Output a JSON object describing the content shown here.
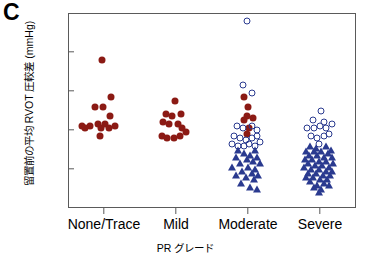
{
  "panel": {
    "letter": "C"
  },
  "axes": {
    "ylabel": "留置前の平均 RVOT 圧較差 (mmHg)",
    "xlabel": "PR グレード",
    "yticks": [
      0,
      20,
      40,
      60,
      80,
      100
    ],
    "ytick_labels": [
      "0",
      "20",
      "40",
      "60",
      "80",
      "100"
    ],
    "xtick_labels": [
      "None/Trace",
      "Mild",
      "Moderate",
      "Severe"
    ]
  },
  "colors": {
    "red": "#8B1A14",
    "blue": "#2A3A8F",
    "frame": "#5a5a5a",
    "background": "#ffffff"
  },
  "chart_data": {
    "type": "scatter",
    "title": "C",
    "xlabel": "PR グレード",
    "ylabel": "留置前の平均 RVOT 圧較差 (mmHg)",
    "ylim": [
      0,
      100
    ],
    "yticks": [
      0,
      20,
      40,
      60,
      80,
      100
    ],
    "grid": false,
    "legend": "none",
    "categories": [
      "None/Trace",
      "Mild",
      "Moderate",
      "Severe"
    ],
    "marker_types": [
      {
        "name": "filled-circle",
        "color": "#8B1A14",
        "shape": "circle",
        "fill": "solid"
      },
      {
        "name": "open-circle",
        "color": "#2A3A8F",
        "shape": "circle",
        "fill": "none"
      },
      {
        "name": "triangle",
        "color": "#2A3A8F",
        "shape": "triangle",
        "fill": "solid"
      }
    ],
    "series": [
      {
        "name": "filled-circle",
        "marker": "filled-circle",
        "points": [
          {
            "category": "None/Trace",
            "jitter": -0.03,
            "y": 76
          },
          {
            "category": "None/Trace",
            "jitter": 0.1,
            "y": 57
          },
          {
            "category": "None/Trace",
            "jitter": -0.12,
            "y": 52
          },
          {
            "category": "None/Trace",
            "jitter": -0.02,
            "y": 52
          },
          {
            "category": "None/Trace",
            "jitter": 0.08,
            "y": 47
          },
          {
            "category": "None/Trace",
            "jitter": -0.3,
            "y": 42
          },
          {
            "category": "None/Trace",
            "jitter": -0.2,
            "y": 42
          },
          {
            "category": "None/Trace",
            "jitter": -0.09,
            "y": 43
          },
          {
            "category": "None/Trace",
            "jitter": -0.04,
            "y": 41
          },
          {
            "category": "None/Trace",
            "jitter": 0.02,
            "y": 43
          },
          {
            "category": "None/Trace",
            "jitter": 0.07,
            "y": 41
          },
          {
            "category": "None/Trace",
            "jitter": 0.15,
            "y": 42
          },
          {
            "category": "None/Trace",
            "jitter": -0.05,
            "y": 37
          },
          {
            "category": "None/Trace",
            "jitter": -0.26,
            "y": 41
          },
          {
            "category": "Mild",
            "jitter": -0.02,
            "y": 55
          },
          {
            "category": "Mild",
            "jitter": -0.14,
            "y": 48
          },
          {
            "category": "Mild",
            "jitter": -0.05,
            "y": 47
          },
          {
            "category": "Mild",
            "jitter": 0.07,
            "y": 48
          },
          {
            "category": "Mild",
            "jitter": -0.18,
            "y": 44
          },
          {
            "category": "Mild",
            "jitter": -0.1,
            "y": 43
          },
          {
            "category": "Mild",
            "jitter": 0.03,
            "y": 43
          },
          {
            "category": "Mild",
            "jitter": 0.09,
            "y": 41
          },
          {
            "category": "Mild",
            "jitter": -0.2,
            "y": 37
          },
          {
            "category": "Mild",
            "jitter": -0.12,
            "y": 36
          },
          {
            "category": "Mild",
            "jitter": -0.03,
            "y": 36
          },
          {
            "category": "Mild",
            "jitter": 0.05,
            "y": 37
          },
          {
            "category": "Mild",
            "jitter": 0.14,
            "y": 39
          },
          {
            "category": "Moderate",
            "jitter": -0.05,
            "y": 57
          },
          {
            "category": "Moderate",
            "jitter": 0.0,
            "y": 52
          },
          {
            "category": "Moderate",
            "jitter": -0.02,
            "y": 47
          },
          {
            "category": "Moderate",
            "jitter": 0.07,
            "y": 46
          },
          {
            "category": "Moderate",
            "jitter": -0.06,
            "y": 45
          },
          {
            "category": "Moderate",
            "jitter": 0.01,
            "y": 41
          },
          {
            "category": "Moderate",
            "jitter": -0.01,
            "y": 38
          }
        ]
      },
      {
        "name": "open-circle",
        "marker": "open-circle",
        "points": [
          {
            "category": "Moderate",
            "jitter": -0.02,
            "y": 96
          },
          {
            "category": "Moderate",
            "jitter": -0.07,
            "y": 63
          },
          {
            "category": "Moderate",
            "jitter": 0.06,
            "y": 59
          },
          {
            "category": "Moderate",
            "jitter": -0.15,
            "y": 42
          },
          {
            "category": "Moderate",
            "jitter": -0.07,
            "y": 41
          },
          {
            "category": "Moderate",
            "jitter": 0.05,
            "y": 42
          },
          {
            "category": "Moderate",
            "jitter": 0.13,
            "y": 40
          },
          {
            "category": "Moderate",
            "jitter": -0.19,
            "y": 37
          },
          {
            "category": "Moderate",
            "jitter": -0.11,
            "y": 36
          },
          {
            "category": "Moderate",
            "jitter": -0.03,
            "y": 35
          },
          {
            "category": "Moderate",
            "jitter": 0.05,
            "y": 36
          },
          {
            "category": "Moderate",
            "jitter": 0.12,
            "y": 37
          },
          {
            "category": "Moderate",
            "jitter": -0.22,
            "y": 33
          },
          {
            "category": "Moderate",
            "jitter": -0.14,
            "y": 32
          },
          {
            "category": "Moderate",
            "jitter": -0.06,
            "y": 32
          },
          {
            "category": "Moderate",
            "jitter": 0.02,
            "y": 33
          },
          {
            "category": "Moderate",
            "jitter": 0.1,
            "y": 32
          },
          {
            "category": "Moderate",
            "jitter": 0.17,
            "y": 34
          },
          {
            "category": "Severe",
            "jitter": 0.02,
            "y": 50
          },
          {
            "category": "Severe",
            "jitter": -0.1,
            "y": 45
          },
          {
            "category": "Severe",
            "jitter": 0.06,
            "y": 44
          },
          {
            "category": "Severe",
            "jitter": -0.18,
            "y": 41
          },
          {
            "category": "Severe",
            "jitter": -0.09,
            "y": 41
          },
          {
            "category": "Severe",
            "jitter": 0.0,
            "y": 42
          },
          {
            "category": "Severe",
            "jitter": 0.09,
            "y": 41
          },
          {
            "category": "Severe",
            "jitter": 0.16,
            "y": 43
          },
          {
            "category": "Severe",
            "jitter": -0.13,
            "y": 37
          },
          {
            "category": "Severe",
            "jitter": -0.04,
            "y": 36
          },
          {
            "category": "Severe",
            "jitter": 0.05,
            "y": 37
          },
          {
            "category": "Severe",
            "jitter": 0.12,
            "y": 38
          },
          {
            "category": "Severe",
            "jitter": -0.02,
            "y": 33
          }
        ]
      },
      {
        "name": "triangle",
        "marker": "triangle",
        "points": [
          {
            "category": "Moderate",
            "jitter": -0.14,
            "y": 30
          },
          {
            "category": "Moderate",
            "jitter": 0.1,
            "y": 30
          },
          {
            "category": "Moderate",
            "jitter": -0.06,
            "y": 28
          },
          {
            "category": "Moderate",
            "jitter": 0.03,
            "y": 27
          },
          {
            "category": "Moderate",
            "jitter": -0.17,
            "y": 26
          },
          {
            "category": "Moderate",
            "jitter": 0.13,
            "y": 26
          },
          {
            "category": "Moderate",
            "jitter": -0.02,
            "y": 25
          },
          {
            "category": "Moderate",
            "jitter": 0.07,
            "y": 24
          },
          {
            "category": "Moderate",
            "jitter": -0.11,
            "y": 23
          },
          {
            "category": "Moderate",
            "jitter": 0.17,
            "y": 23
          },
          {
            "category": "Moderate",
            "jitter": -0.22,
            "y": 21
          },
          {
            "category": "Moderate",
            "jitter": 0.0,
            "y": 21
          },
          {
            "category": "Moderate",
            "jitter": 0.1,
            "y": 20
          },
          {
            "category": "Moderate",
            "jitter": -0.08,
            "y": 19
          },
          {
            "category": "Moderate",
            "jitter": 0.05,
            "y": 18
          },
          {
            "category": "Moderate",
            "jitter": -0.16,
            "y": 17
          },
          {
            "category": "Moderate",
            "jitter": 0.14,
            "y": 17
          },
          {
            "category": "Moderate",
            "jitter": -0.03,
            "y": 16
          },
          {
            "category": "Moderate",
            "jitter": 0.08,
            "y": 15
          },
          {
            "category": "Moderate",
            "jitter": -0.1,
            "y": 13
          },
          {
            "category": "Moderate",
            "jitter": 0.03,
            "y": 11
          },
          {
            "category": "Moderate",
            "jitter": 0.12,
            "y": 10
          },
          {
            "category": "Severe",
            "jitter": -0.14,
            "y": 32
          },
          {
            "category": "Severe",
            "jitter": 0.08,
            "y": 32
          },
          {
            "category": "Severe",
            "jitter": -0.05,
            "y": 31
          },
          {
            "category": "Severe",
            "jitter": 0.15,
            "y": 30
          },
          {
            "category": "Severe",
            "jitter": -0.19,
            "y": 29
          },
          {
            "category": "Severe",
            "jitter": -0.09,
            "y": 29
          },
          {
            "category": "Severe",
            "jitter": 0.01,
            "y": 29
          },
          {
            "category": "Severe",
            "jitter": 0.11,
            "y": 28
          },
          {
            "category": "Severe",
            "jitter": -0.15,
            "y": 27
          },
          {
            "category": "Severe",
            "jitter": -0.04,
            "y": 27
          },
          {
            "category": "Severe",
            "jitter": 0.06,
            "y": 26
          },
          {
            "category": "Severe",
            "jitter": 0.16,
            "y": 26
          },
          {
            "category": "Severe",
            "jitter": -0.21,
            "y": 25
          },
          {
            "category": "Severe",
            "jitter": -0.11,
            "y": 25
          },
          {
            "category": "Severe",
            "jitter": -0.01,
            "y": 24
          },
          {
            "category": "Severe",
            "jitter": 0.09,
            "y": 24
          },
          {
            "category": "Severe",
            "jitter": 0.18,
            "y": 23
          },
          {
            "category": "Severe",
            "jitter": -0.17,
            "y": 23
          },
          {
            "category": "Severe",
            "jitter": -0.07,
            "y": 22
          },
          {
            "category": "Severe",
            "jitter": 0.03,
            "y": 22
          },
          {
            "category": "Severe",
            "jitter": 0.13,
            "y": 21
          },
          {
            "category": "Severe",
            "jitter": -0.22,
            "y": 21
          },
          {
            "category": "Severe",
            "jitter": -0.12,
            "y": 20
          },
          {
            "category": "Severe",
            "jitter": -0.02,
            "y": 20
          },
          {
            "category": "Severe",
            "jitter": 0.08,
            "y": 19
          },
          {
            "category": "Severe",
            "jitter": 0.17,
            "y": 19
          },
          {
            "category": "Severe",
            "jitter": -0.16,
            "y": 18
          },
          {
            "category": "Severe",
            "jitter": -0.06,
            "y": 18
          },
          {
            "category": "Severe",
            "jitter": 0.04,
            "y": 17
          },
          {
            "category": "Severe",
            "jitter": 0.14,
            "y": 17
          },
          {
            "category": "Severe",
            "jitter": -0.2,
            "y": 16
          },
          {
            "category": "Severe",
            "jitter": -0.1,
            "y": 16
          },
          {
            "category": "Severe",
            "jitter": 0.0,
            "y": 15
          },
          {
            "category": "Severe",
            "jitter": 0.1,
            "y": 15
          },
          {
            "category": "Severe",
            "jitter": -0.14,
            "y": 14
          },
          {
            "category": "Severe",
            "jitter": 0.06,
            "y": 13
          },
          {
            "category": "Severe",
            "jitter": -0.04,
            "y": 12
          },
          {
            "category": "Severe",
            "jitter": 0.12,
            "y": 12
          },
          {
            "category": "Severe",
            "jitter": -0.09,
            "y": 11
          },
          {
            "category": "Severe",
            "jitter": 0.02,
            "y": 10
          },
          {
            "category": "Severe",
            "jitter": -0.01,
            "y": 8
          }
        ]
      }
    ]
  }
}
